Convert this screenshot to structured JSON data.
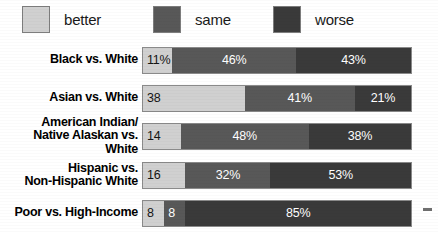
{
  "chart_data": {
    "type": "bar",
    "subtype": "stacked-horizontal-100",
    "title": "",
    "xlabel": "",
    "ylabel": "",
    "xlim": [
      0,
      100
    ],
    "grid": false,
    "legend_position": "top",
    "categories": [
      "Black vs. White",
      "Asian vs. White",
      "American Indian/\nNative Alaskan vs. White",
      "Hispanic vs.\nNon-Hispanic White",
      "Poor vs. High-Income"
    ],
    "series": [
      {
        "name": "better",
        "color": "#d0d0d0",
        "values": [
          11,
          38,
          14,
          16,
          8
        ]
      },
      {
        "name": "same",
        "color": "#585858",
        "values": [
          46,
          41,
          48,
          32,
          8
        ]
      },
      {
        "name": "worse",
        "color": "#3a3a3a",
        "values": [
          43,
          21,
          38,
          53,
          85
        ]
      }
    ],
    "data_labels": [
      [
        "11%",
        "46%",
        "43%"
      ],
      [
        "38",
        "41%",
        "21%"
      ],
      [
        "14",
        "48%",
        "38%"
      ],
      [
        "16",
        "32%",
        "53%"
      ],
      [
        "8",
        "8",
        "85%"
      ]
    ]
  },
  "legend": {
    "items": [
      {
        "label": "better",
        "color": "#d0d0d0"
      },
      {
        "label": "same",
        "color": "#585858"
      },
      {
        "label": "worse",
        "color": "#3a3a3a"
      }
    ]
  },
  "rows": [
    {
      "label": "Black vs. White",
      "segments": [
        {
          "series": "better",
          "value": 11,
          "text": "11%"
        },
        {
          "series": "same",
          "value": 46,
          "text": "46%"
        },
        {
          "series": "worse",
          "value": 43,
          "text": "43%"
        }
      ]
    },
    {
      "label": "Asian vs. White",
      "segments": [
        {
          "series": "better",
          "value": 38,
          "text": "38"
        },
        {
          "series": "same",
          "value": 41,
          "text": "41%"
        },
        {
          "series": "worse",
          "value": 21,
          "text": "21%"
        }
      ]
    },
    {
      "label": "American Indian/\nNative Alaskan vs. White",
      "segments": [
        {
          "series": "better",
          "value": 14,
          "text": "14"
        },
        {
          "series": "same",
          "value": 48,
          "text": "48%"
        },
        {
          "series": "worse",
          "value": 38,
          "text": "38%"
        }
      ]
    },
    {
      "label": "Hispanic vs.\nNon-Hispanic White",
      "segments": [
        {
          "series": "better",
          "value": 16,
          "text": "16"
        },
        {
          "series": "same",
          "value": 32,
          "text": "32%"
        },
        {
          "series": "worse",
          "value": 53,
          "text": "53%"
        }
      ]
    },
    {
      "label": "Poor vs. High-Income",
      "segments": [
        {
          "series": "better",
          "value": 8,
          "text": "8"
        },
        {
          "series": "same",
          "value": 8,
          "text": "8"
        },
        {
          "series": "worse",
          "value": 85,
          "text": "85%"
        }
      ]
    }
  ]
}
